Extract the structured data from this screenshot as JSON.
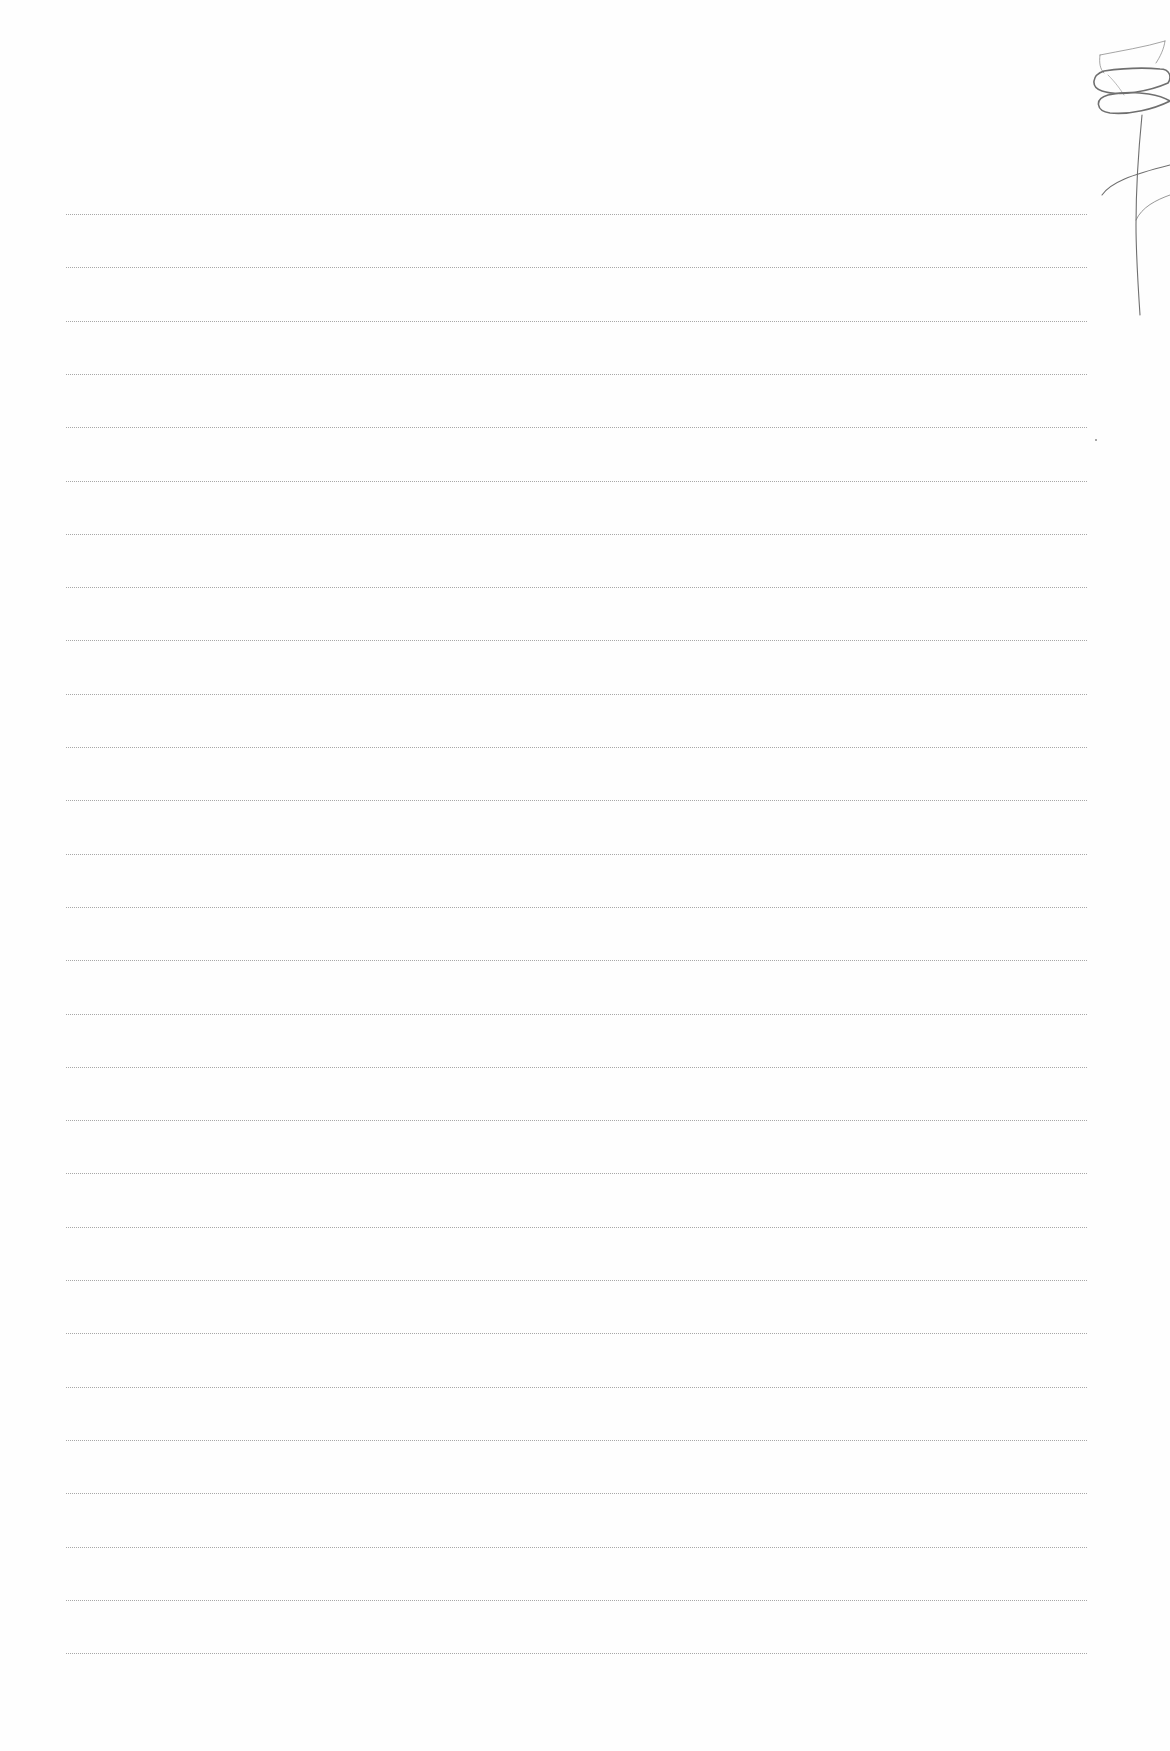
{
  "page": {
    "type": "lined-notebook-paper",
    "background_color": "#fefefe",
    "line_color": "#9a9a9a",
    "line_count": 28,
    "line_left": 66,
    "line_right": 1087,
    "first_line_y": 214,
    "line_spacing": 53.3
  },
  "doodle": {
    "subject": "flower-sketch",
    "stroke_color": "#6f6f6f"
  }
}
